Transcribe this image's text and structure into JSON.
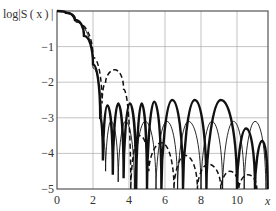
{
  "chart_data": {
    "type": "line",
    "title": "",
    "ylabel": "log|S(x)|",
    "xlabel": "x",
    "xlim": [
      0,
      11.7
    ],
    "ylim": [
      -5,
      0
    ],
    "x_ticks": [
      "0",
      "2",
      "4",
      "6",
      "8",
      "10",
      "x"
    ],
    "y_ticks": [
      "-1",
      "-2",
      "-3",
      "-4",
      "-5"
    ],
    "grid": true,
    "legend": null,
    "series": [
      {
        "name": "thick solid",
        "style": "solid-thick",
        "description": "Main lobe falls from 0 to null near x=2.5; side lobes peak ~ -2.6 with nulls near x=2.5,3.1,3.7,4.3,5.0,5.8,7.0,8.3,10.0,11.0; later lobes drop to ~ -3.3 and -3.6",
        "points": [
          [
            0,
            0
          ],
          [
            0.5,
            -0.05
          ],
          [
            1,
            -0.25
          ],
          [
            1.5,
            -0.7
          ],
          [
            2,
            -1.5
          ],
          [
            2.4,
            -3
          ],
          [
            2.55,
            -4.2
          ],
          [
            2.8,
            -2.65
          ],
          [
            3.1,
            -4.6
          ],
          [
            3.4,
            -2.6
          ],
          [
            3.7,
            -4.7
          ],
          [
            4.05,
            -2.6
          ],
          [
            4.4,
            -5
          ],
          [
            4.7,
            -2.6
          ],
          [
            5.0,
            -5
          ],
          [
            5.4,
            -2.55
          ],
          [
            5.8,
            -5
          ],
          [
            6.4,
            -2.5
          ],
          [
            7.0,
            -5
          ],
          [
            7.65,
            -2.5
          ],
          [
            8.3,
            -5
          ],
          [
            9.1,
            -2.5
          ],
          [
            10.0,
            -5
          ],
          [
            10.5,
            -3.3
          ],
          [
            11.0,
            -5
          ],
          [
            11.4,
            -3.65
          ],
          [
            11.7,
            -5
          ]
        ]
      },
      {
        "name": "thin solid",
        "style": "solid-thin",
        "description": "Side lobes peaking around -3.1",
        "points": [
          [
            0,
            0
          ],
          [
            1,
            -0.3
          ],
          [
            2,
            -1.6
          ],
          [
            2.5,
            -3.5
          ],
          [
            2.7,
            -4.5
          ],
          [
            3.0,
            -3.1
          ],
          [
            3.4,
            -4.8
          ],
          [
            3.8,
            -3.1
          ],
          [
            4.3,
            -5
          ],
          [
            4.9,
            -3.1
          ],
          [
            5.5,
            -5
          ],
          [
            6.1,
            -3.1
          ],
          [
            6.7,
            -5
          ],
          [
            7.3,
            -3.1
          ],
          [
            8.0,
            -5
          ],
          [
            8.6,
            -3.1
          ],
          [
            9.2,
            -5
          ],
          [
            9.8,
            -3.1
          ],
          [
            10.4,
            -5
          ],
          [
            11.0,
            -3.1
          ],
          [
            11.6,
            -5
          ]
        ]
      },
      {
        "name": "dashed",
        "style": "dashed",
        "description": "Wider main lobe; first side lobe ~ -1.7 near x=3.2, then decaying lobes",
        "points": [
          [
            0,
            0
          ],
          [
            1,
            -0.3
          ],
          [
            2,
            -1.3
          ],
          [
            2.5,
            -2.6
          ],
          [
            2.7,
            -2.0
          ],
          [
            3.2,
            -1.65
          ],
          [
            3.7,
            -2.2
          ],
          [
            4.1,
            -5
          ],
          [
            4.6,
            -3.5
          ],
          [
            5.1,
            -4.5
          ],
          [
            5.8,
            -3.7
          ],
          [
            6.5,
            -5
          ],
          [
            7.1,
            -4.05
          ],
          [
            7.8,
            -5
          ],
          [
            8.4,
            -4.3
          ],
          [
            9.1,
            -5
          ],
          [
            9.6,
            -4.5
          ],
          [
            10.1,
            -5
          ],
          [
            10.6,
            -4.6
          ],
          [
            11.1,
            -5
          ]
        ]
      }
    ]
  },
  "axes": {
    "ylabel": "log|S ( x ) |",
    "xlabel_end": "x",
    "xticks": [
      {
        "label": "0",
        "v": 0
      },
      {
        "label": "2",
        "v": 2
      },
      {
        "label": "4",
        "v": 4
      },
      {
        "label": "6",
        "v": 6
      },
      {
        "label": "8",
        "v": 8
      },
      {
        "label": "10",
        "v": 10
      }
    ],
    "yticks": [
      {
        "label": "−1",
        "v": -1
      },
      {
        "label": "−2",
        "v": -2
      },
      {
        "label": "−3",
        "v": -3
      },
      {
        "label": "−4",
        "v": -4
      },
      {
        "label": "−5",
        "v": -5
      }
    ]
  }
}
